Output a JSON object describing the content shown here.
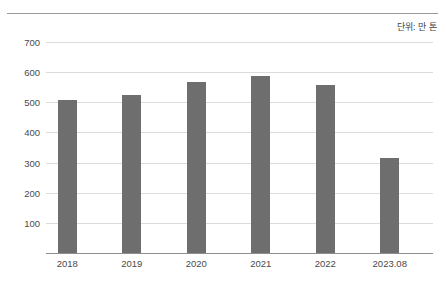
{
  "annotations": {
    "unit_note": "단위: 만 톤"
  },
  "chart_data": {
    "type": "bar",
    "title": "",
    "subtitle": "",
    "xlabel": "",
    "ylabel": "",
    "categories": [
      "2018",
      "2019",
      "2020",
      "2021",
      "2022",
      "2023.08"
    ],
    "values": [
      508,
      524,
      568,
      586,
      558,
      316
    ],
    "ylim": [
      0,
      700
    ],
    "yticks": [
      100,
      200,
      300,
      400,
      500,
      600,
      700
    ],
    "ytick_labels": [
      "100",
      "200",
      "300",
      "400",
      "500",
      "600",
      "700"
    ],
    "grid": true,
    "legend": null,
    "series": [
      {
        "name": "",
        "values": [
          508,
          524,
          568,
          586,
          558,
          316
        ],
        "color": "#6e6e6e"
      }
    ],
    "annotations": [
      "단위: 만 톤"
    ],
    "colors": {
      "bar": "#6e6e6e",
      "grid": "#dcdcdc",
      "axis": "#8e8e8e",
      "text": "#4a4a4a",
      "background": "#ffffff"
    }
  }
}
